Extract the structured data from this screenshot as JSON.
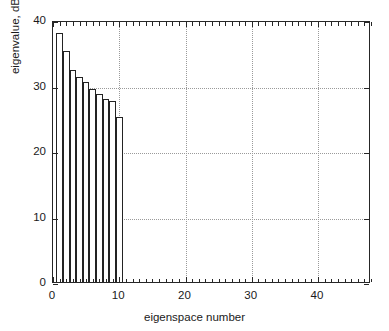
{
  "chart_data": {
    "type": "bar",
    "title": "",
    "xlabel": "eigenspace number",
    "ylabel": "eigenvalue, dB",
    "xlim": [
      0,
      48
    ],
    "ylim": [
      0,
      40
    ],
    "xticks": [
      0,
      10,
      20,
      30,
      40
    ],
    "yticks": [
      0,
      10,
      20,
      30,
      40
    ],
    "xtick_labels": [
      "0",
      "10",
      "20",
      "30",
      "40"
    ],
    "ytick_labels": [
      "0",
      "10",
      "20",
      "30",
      "40"
    ],
    "x_minor_tick_step": 1,
    "grid": true,
    "grid_style": "dotted",
    "legend": "none",
    "categories": [
      1,
      2,
      3,
      4,
      5,
      6,
      7,
      8,
      9,
      10
    ],
    "values": [
      38.0,
      35.3,
      32.3,
      31.3,
      30.5,
      29.5,
      28.7,
      28.0,
      27.7,
      25.2
    ],
    "bar_fill_color": "#ffffff",
    "bar_edge_color": "#232323",
    "axis_color": "#262626",
    "grid_color": "#9a9a9a",
    "background_color": "#ffffff"
  }
}
